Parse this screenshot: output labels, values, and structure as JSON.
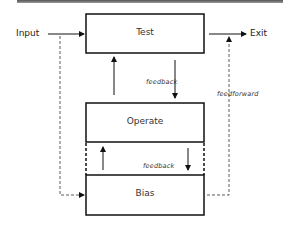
{
  "diagram": {
    "nodes": [
      {
        "id": "test",
        "label": "Test"
      },
      {
        "id": "operate",
        "label": "Operate"
      },
      {
        "id": "bias",
        "label": "Bias"
      }
    ],
    "terminals": {
      "input": "Input",
      "exit": "Exit"
    },
    "edge_labels": {
      "feedback_test_operate": "feedback",
      "feedback_operate_bias": "feedback",
      "feedforward": "feedforward"
    },
    "edges": [
      {
        "from": "input",
        "to": "test",
        "style": "solid"
      },
      {
        "from": "test",
        "to": "exit",
        "style": "solid"
      },
      {
        "from": "test",
        "to": "operate",
        "style": "solid",
        "label": "feedback"
      },
      {
        "from": "operate",
        "to": "test",
        "style": "solid"
      },
      {
        "from": "operate",
        "to": "bias",
        "style": "solid",
        "label": "feedback"
      },
      {
        "from": "bias",
        "to": "operate",
        "style": "solid"
      },
      {
        "from": "input",
        "to": "bias",
        "style": "dashed"
      },
      {
        "from": "bias",
        "to": "exit",
        "style": "dashed",
        "label": "feedforward"
      }
    ]
  }
}
